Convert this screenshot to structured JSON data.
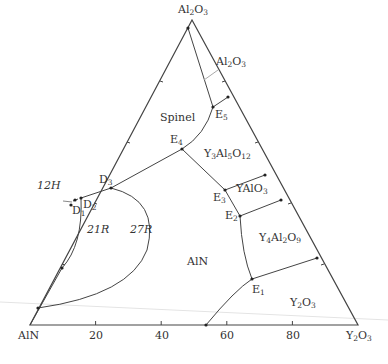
{
  "diagram": {
    "type": "ternary-phase-diagram",
    "vertices": {
      "top": {
        "label": "Al2O3",
        "x": 192,
        "y": 20
      },
      "left": {
        "label": "AlN",
        "x": 30,
        "y": 325
      },
      "right": {
        "label": "Y2O3",
        "x": 358,
        "y": 325
      }
    },
    "base_axis_ticks": [
      "20",
      "40",
      "60",
      "80"
    ],
    "line_color": "#444444",
    "phase_fields": [
      "Al2O3",
      "Spinel",
      "Y3Al5O12",
      "YAlO3",
      "Y4Al2O9",
      "Y2O3",
      "AlN",
      "27R",
      "21R",
      "12H"
    ],
    "invariant_points": [
      "E1",
      "E2",
      "E3",
      "E4",
      "E5",
      "D1",
      "D2",
      "D3"
    ]
  },
  "labels": {
    "apex": "Al2O3",
    "left_vertex": "AlN",
    "right_vertex": "Y2O3",
    "tick_20": "20",
    "tick_40": "40",
    "tick_60": "60",
    "tick_80": "80",
    "field_al2o3": "Al2O3",
    "field_spinel": "Spinel",
    "field_yag": "Y3Al5O12",
    "field_yalo3": "YAlO3",
    "field_y4al2o9": "Y4Al2O9",
    "field_y2o3": "Y2O3",
    "field_aln": "AlN",
    "field_27r": "27R",
    "field_21r": "21R",
    "field_12h": "12H",
    "pt_e1": "E1",
    "pt_e2": "E2",
    "pt_e3": "E3",
    "pt_e4": "E4",
    "pt_e5": "E5",
    "pt_d1": "D1",
    "pt_d2": "D2",
    "pt_d3": "D3"
  }
}
